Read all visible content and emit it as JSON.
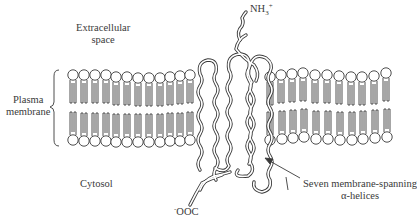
{
  "diagram": {
    "type": "membrane-receptor-schematic",
    "labels": {
      "extracellular": [
        "Extracellular",
        "space"
      ],
      "plasma_membrane": [
        "Plasma",
        "membrane"
      ],
      "cytosol": "Cytosol",
      "n_terminus": {
        "base": "NH",
        "sub": "3",
        "sup": "+"
      },
      "c_terminus": {
        "sup": "-",
        "base": "OOC"
      },
      "helices": [
        "Seven membrane-spanning",
        "α-helices"
      ]
    },
    "membrane": {
      "left_lipid_count": 12,
      "right_lipid_count": 11
    },
    "helix_count": 7,
    "colors": {
      "line": "#3a3a3a",
      "background": "#ffffff"
    }
  }
}
